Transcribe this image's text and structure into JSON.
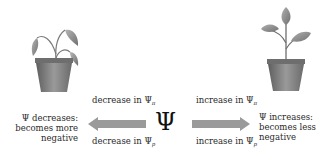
{
  "diagram": {
    "center_symbol": "Ψ",
    "left": {
      "description": "wilted plant",
      "label_line1": "Ψ decreases:",
      "label_line2": "becomes more",
      "label_line3": "negative",
      "arrow_direction": "left",
      "top_label": "decrease in Ψ",
      "top_label_sub": "π",
      "bottom_label": "decrease in Ψ",
      "bottom_label_sub": "p"
    },
    "right": {
      "description": "healthy upright plant",
      "label_line1": "Ψ increases:",
      "label_line2": "becomes less",
      "label_line3": "negative",
      "arrow_direction": "right",
      "top_label": "increase in Ψ",
      "top_label_sub": "π",
      "bottom_label": "increase in Ψ",
      "bottom_label_sub": "p"
    },
    "colors": {
      "arrow": "#9a9a9a",
      "pot": "#777777",
      "leaf": "#8c8c8c",
      "text": "#2a2a2a"
    }
  }
}
